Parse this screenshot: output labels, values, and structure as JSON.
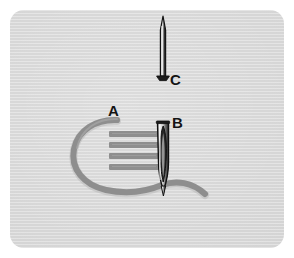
{
  "figure": {
    "type": "instructional-diagram",
    "panel": {
      "background_color": "#d6d6d6",
      "page_color": "#ffffff",
      "corner_radius_px": 14
    },
    "colors": {
      "thread": "#8e8e8e",
      "thread_shadow": "#7c7c7c",
      "stitch_bar": "#8e8e8e",
      "needle_outline": "#111111",
      "needle_body_light": "#e9e9e9",
      "needle_body_dark": "#3a3a3a",
      "label_text": "#141414"
    }
  },
  "labels": [
    {
      "id": "A",
      "text": "A",
      "refers_to": "thread loop entering the stitched area"
    },
    {
      "id": "B",
      "text": "B",
      "refers_to": "threading needle with long eye piercing the fabric"
    },
    {
      "id": "C",
      "text": "C",
      "refers_to": "fine straight pin shown above for comparison"
    }
  ],
  "elements": {
    "needle_c": {
      "name": "fine pin",
      "label": "C",
      "orientation": "vertical, point up",
      "top_y": 16,
      "bottom_y": 79,
      "center_x": 163
    },
    "needle_b": {
      "name": "eyed needle",
      "label": "B",
      "orientation": "vertical, point down",
      "top_y": 122,
      "bottom_y": 192,
      "center_x": 163,
      "has_eye": true
    },
    "stitch_bars": {
      "name": "satin stitch bars",
      "count": 4,
      "orientation": "horizontal",
      "left_x": 109,
      "right_x": 160,
      "rows_y": [
        134,
        145,
        156,
        167
      ],
      "thickness_px": 6
    },
    "thread": {
      "name": "working thread",
      "label": "A",
      "path_description": "loops left from the top of the stitch block, sweeps down and around, passes beneath the needle and exits to the lower right",
      "stroke_width_px": 6
    }
  }
}
